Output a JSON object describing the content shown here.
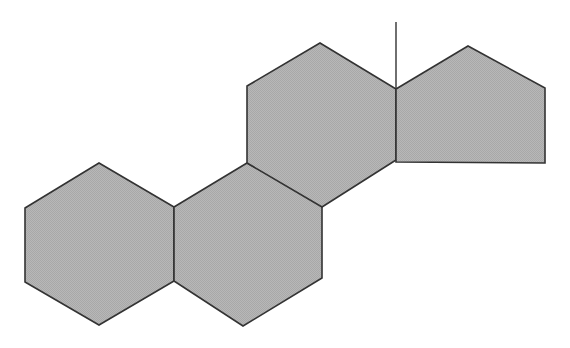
{
  "figure": {
    "canvas": {
      "width": 570,
      "height": 348,
      "background_color": "#ffffff"
    },
    "style": {
      "fill_color": "#b3b3b3",
      "stroke_color": "#333333",
      "stroke_width": 1.6,
      "bond_stroke_width": 1.4
    },
    "shapes": [
      {
        "id": "ring-a",
        "label": "Ring A",
        "kind": "hexagon",
        "sides": 6,
        "points": "25,208 99,163 174,207 174,281 99,325 25,282",
        "fill_color": "#b3b3b3",
        "stroke_color": "#333333"
      },
      {
        "id": "ring-b",
        "label": "Ring B",
        "kind": "hexagon",
        "sides": 6,
        "points": "174,207 247,163 322,203 322,278 243,326 174,281",
        "fill_color": "#b3b3b3",
        "stroke_color": "#333333"
      },
      {
        "id": "ring-c",
        "label": "Ring C",
        "kind": "hexagon",
        "sides": 6,
        "points": "247,86 320,43 396,89 396,160 322,207 247,163",
        "fill_color": "#b3b3b3",
        "stroke_color": "#333333"
      },
      {
        "id": "ring-d",
        "label": "Ring D",
        "kind": "pentagon",
        "sides": 5,
        "points": "396,89 468,46 545,88 545,163 396,162",
        "fill_color": "#b3b3b3",
        "stroke_color": "#333333"
      }
    ],
    "bonds": [
      {
        "id": "methyl-bond",
        "label": "Vertical bond at ring C / ring D fusion vertex",
        "x1": 396,
        "y1": 22,
        "x2": 396,
        "y2": 89,
        "stroke_color": "#333333"
      }
    ]
  }
}
